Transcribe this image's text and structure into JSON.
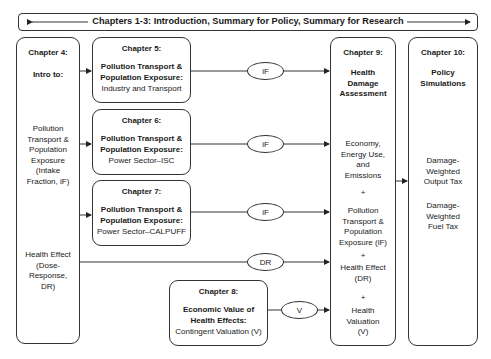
{
  "banner": {
    "text": "Chapters 1-3:  Introduction, Summary for Policy, Summary for Research"
  },
  "chapter4": {
    "title": "Chapter 4:",
    "subtitle": "Intro to:",
    "item1": [
      "Pollution",
      "Transport &",
      "Population",
      "Exposure",
      "(Intake",
      "Fraction, iF)"
    ],
    "item2": [
      "Health Effect",
      "(Dose-",
      "Response,",
      "DR)"
    ]
  },
  "chapter5": {
    "title": "Chapter 5:",
    "bold_line1": "Pollution Transport &",
    "bold_line2": "Population Exposure:",
    "detail": "Industry and Transport"
  },
  "chapter6": {
    "title": "Chapter 6:",
    "bold_line1": "Pollution Transport &",
    "bold_line2": "Population Exposure:",
    "detail": "Power Sector–ISC"
  },
  "chapter7": {
    "title": "Chapter 7:",
    "bold_line1": "Pollution Transport &",
    "bold_line2": "Population Exposure:",
    "detail": "Power Sector–CALPUFF"
  },
  "chapter8": {
    "title": "Chapter 8:",
    "bold_line1": "Economic Value of",
    "bold_line2": "Health Effects:",
    "detail": "Contingent Valuation (V)"
  },
  "chapter9": {
    "title": "Chapter 9:",
    "heading": [
      "Health",
      "Damage",
      "Assessment"
    ],
    "block1": [
      "Economy,",
      "Energy Use,",
      "and",
      "Emissions"
    ],
    "plus": "+",
    "block2": [
      "Pollution",
      "Transport &",
      "Population",
      "Exposure (iF)"
    ],
    "block3": [
      "Health Effect",
      "(DR)"
    ],
    "block4": [
      "Health",
      "Valuation",
      "(V)"
    ]
  },
  "chapter10": {
    "title": "Chapter 10:",
    "heading": [
      "Policy",
      "Simulations"
    ],
    "item1": [
      "Damage-",
      "Weighted",
      "Output Tax"
    ],
    "item2": [
      "Damage-",
      "Weighted",
      "Fuel Tax"
    ]
  },
  "connectors": {
    "if1": "iF",
    "if2": "iF",
    "if3": "iF",
    "dr": "DR",
    "v": "V"
  }
}
